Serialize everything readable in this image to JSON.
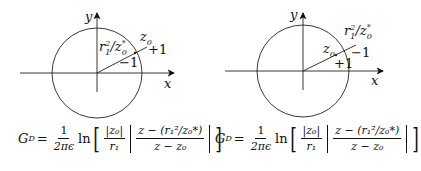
{
  "diagrams": [
    {
      "id": "left",
      "axis_x_label": "x",
      "axis_y_label": "y",
      "labels": {
        "source": "z",
        "source_sub": "0",
        "source_charge": "+1",
        "image": "r",
        "image_sup": "2",
        "image_sub": "1",
        "image_mid": "/z",
        "image_sup2": "*",
        "image_sub2": "0",
        "image_charge": "−1"
      },
      "description": "source z0 outside circle, image r1^2/z0* inside"
    },
    {
      "id": "right",
      "axis_x_label": "x",
      "axis_y_label": "y",
      "labels": {
        "source": "z",
        "source_sub": "0",
        "source_charge": "+1",
        "image": "r",
        "image_sup": "2",
        "image_sub": "1",
        "image_mid": "/z",
        "image_sup2": "*",
        "image_sub2": "0",
        "image_charge": "−1"
      },
      "description": "source z0 inside circle, image r1^2/z0* outside"
    }
  ],
  "formula": {
    "lhs": "G",
    "lhs_sub": "D",
    "eq": "=",
    "coef_num": "1",
    "coef_den": "2πϵ",
    "ln": "ln",
    "abs_num": "|z₀|",
    "abs_den": "r₁",
    "main_num": "z − (r₁²/z₀*)",
    "main_den": "z − z₀"
  }
}
